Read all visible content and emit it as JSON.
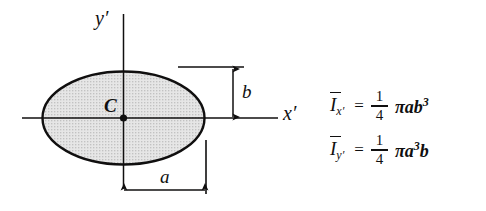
{
  "figure": {
    "kind": "engineering-diagram",
    "background_color": "#ffffff",
    "ink_color": "#100f0f",
    "fill_color": "#dcdcdc"
  },
  "diagram": {
    "shape_name": "ellipse",
    "centroid_label": "C",
    "axes": [
      {
        "name": "x-prime-axis",
        "label": "x′",
        "orientation": "horizontal"
      },
      {
        "name": "y-prime-axis",
        "label": "y′",
        "orientation": "vertical"
      }
    ],
    "dimensions": [
      {
        "name": "semi-minor-axis",
        "label": "b",
        "orientation": "vertical"
      },
      {
        "name": "semi-major-axis",
        "label": "a",
        "orientation": "horizontal"
      }
    ]
  },
  "formulas": [
    {
      "name": "moment-of-inertia-x",
      "symbol": "I",
      "subscript": "x′",
      "equals": "=",
      "fraction_numerator": "1",
      "fraction_denominator": "4",
      "pi": "π",
      "term_base": "ab",
      "term_exponent": "3",
      "full_text": "Ī x′ = 1/4 πab³"
    },
    {
      "name": "moment-of-inertia-y",
      "symbol": "I",
      "subscript": "y′",
      "equals": "=",
      "fraction_numerator": "1",
      "fraction_denominator": "4",
      "pi": "π",
      "term_base_pre": "a",
      "term_exponent": "3",
      "term_base_post": "b",
      "full_text": "Ī y′ = 1/4 πa³b"
    }
  ]
}
